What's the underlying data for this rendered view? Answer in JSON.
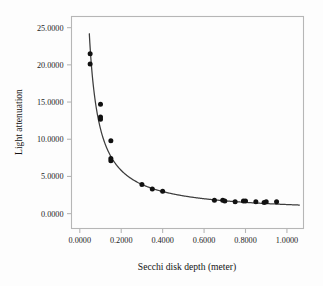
{
  "chart_data": {
    "type": "scatter",
    "title": "",
    "subtitle": "",
    "xlabel": "Secchi disk depth (meter)",
    "ylabel": "Light attenuation",
    "xlim": [
      -0.04,
      1.08
    ],
    "ylim": [
      -2.0,
      26.5
    ],
    "grid": false,
    "legend": null,
    "x_ticks": [
      0.0,
      0.2,
      0.4,
      0.6,
      0.8,
      1.0
    ],
    "x_tick_labels": [
      "0.0000",
      "0.2000",
      "0.4000",
      "0.6000",
      "0.8000",
      "1.0000"
    ],
    "y_ticks": [
      0.0,
      5.0,
      10.0,
      15.0,
      20.0,
      25.0
    ],
    "y_tick_labels": [
      "0.0000",
      "5.0000",
      "10.0000",
      "15.0000",
      "20.0000",
      "25.0000"
    ],
    "marker_color": "#111111",
    "curve_color": "#3d3d3d",
    "frame_color": "#b6b6b6",
    "points": [
      {
        "x": 0.05,
        "y": 21.5
      },
      {
        "x": 0.05,
        "y": 20.1
      },
      {
        "x": 0.1,
        "y": 14.7
      },
      {
        "x": 0.1,
        "y": 13.0
      },
      {
        "x": 0.1,
        "y": 12.7
      },
      {
        "x": 0.15,
        "y": 9.8
      },
      {
        "x": 0.15,
        "y": 7.4
      },
      {
        "x": 0.15,
        "y": 7.1
      },
      {
        "x": 0.3,
        "y": 3.9
      },
      {
        "x": 0.35,
        "y": 3.3
      },
      {
        "x": 0.4,
        "y": 3.0
      },
      {
        "x": 0.65,
        "y": 1.8
      },
      {
        "x": 0.69,
        "y": 1.8
      },
      {
        "x": 0.7,
        "y": 1.7
      },
      {
        "x": 0.75,
        "y": 1.6
      },
      {
        "x": 0.79,
        "y": 1.7
      },
      {
        "x": 0.8,
        "y": 1.7
      },
      {
        "x": 0.85,
        "y": 1.6
      },
      {
        "x": 0.89,
        "y": 1.5
      },
      {
        "x": 0.9,
        "y": 1.6
      },
      {
        "x": 0.95,
        "y": 1.6
      }
    ],
    "fit_curve": {
      "label": "",
      "form": "power",
      "a": 1.22,
      "b": -0.97,
      "x_start": 0.046,
      "x_end": 1.06
    }
  }
}
